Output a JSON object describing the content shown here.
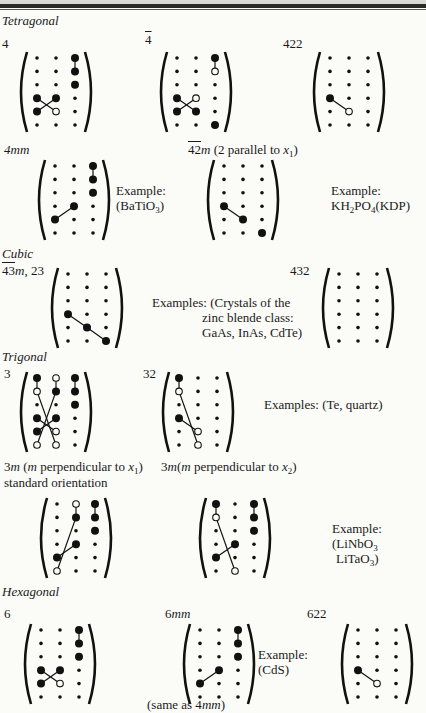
{
  "document": {
    "sections": [
      {
        "name": "Tetragonal",
        "groups": [
          {
            "label": "4",
            "x": 2,
            "y": 36,
            "matrix": "m4"
          },
          {
            "label": "4̄",
            "x": 145,
            "y": 32,
            "matrix": "m4bar"
          },
          {
            "label": "422",
            "x": 283,
            "y": 36,
            "matrix": "m422"
          },
          {
            "label": "4mm",
            "x": 2,
            "y": 142,
            "matrix": "m4mm",
            "example": [
              "Example:",
              "(BaTiO₃)"
            ]
          },
          {
            "label": "4̄2m (2 parallel to x₁)",
            "x": 188,
            "y": 142,
            "matrix": "m42m",
            "example": [
              "Example:",
              "KH₂PO₄(KDP)"
            ]
          }
        ]
      },
      {
        "name": "Cubic",
        "groups": [
          {
            "label": "4̄3m, 23",
            "x": 2,
            "y": 267,
            "matrix": "m43m",
            "example": [
              "Examples: (Crystals of the",
              "zinc blende class:",
              "GaAs, InAs, CdTe)"
            ]
          },
          {
            "label": "432",
            "x": 277,
            "y": 267,
            "matrix": "m432"
          }
        ]
      },
      {
        "name": "Trigonal",
        "groups": [
          {
            "label": "3",
            "x": 2,
            "y": 373,
            "matrix": "m3"
          },
          {
            "label": "32",
            "x": 143,
            "y": 373,
            "matrix": "m32",
            "example": [
              "Examples: (Te, quartz)"
            ]
          },
          {
            "label": "3m (m perpendicular to x₁) standard orientation",
            "matrix": "m3m1"
          },
          {
            "label": "3m(m perpendicular to x₂)",
            "matrix": "m3m2",
            "example": [
              "Example:",
              "(LiNbO₃",
              "LiTaO₃)"
            ]
          }
        ]
      },
      {
        "name": "Hexagonal",
        "groups": [
          {
            "label": "6",
            "matrix": "m6"
          },
          {
            "label": "6mm",
            "matrix": "m6mm",
            "example": [
              "Example:",
              "(CdS)"
            ],
            "note": "(same as 4mm)"
          },
          {
            "label": "622",
            "matrix": "m622"
          }
        ]
      }
    ],
    "text": {
      "tetragonal": "Tetragonal",
      "cubic": "Cubic",
      "trigonal": "Trigonal",
      "hexagonal": "Hexagonal",
      "l4": "4",
      "l4bar_num": "4",
      "l422": "422",
      "l4mm": "4mm",
      "l42m_a": "42",
      "l42m_m": "m",
      "l42m_b": " (2 parallel to ",
      "l42m_x": "x",
      "l42m_sub": "1",
      "l42m_c": ")",
      "ex_label": "Example:",
      "ex_batio_a": "(BaTiO",
      "ex_batio_sub": "3",
      "ex_batio_b": ")",
      "ex_kdp_a": "KH",
      "ex_kdp_sub1": "2",
      "ex_kdp_b": "PO",
      "ex_kdp_sub2": "4",
      "ex_kdp_c": "(KDP)",
      "l43m_a": "43",
      "l43m_m": "m",
      "l43m_b": ", 23",
      "ex_cubic_1": "Examples: (Crystals of the",
      "ex_cubic_2": "zinc blende class:",
      "ex_cubic_3": "GaAs, InAs, CdTe)",
      "l432": "432",
      "l3": "3",
      "l32": "32",
      "ex_trig": "Examples: (Te, quartz)",
      "l3m1_a": "3",
      "l3m1_m": "m",
      "l3m1_b": " (",
      "l3m1_m2": "m",
      "l3m1_c": " perpendicular to ",
      "l3m1_x": "x",
      "l3m1_sub": "1",
      "l3m1_d": ")",
      "l3m1_line2": "standard orientation",
      "l3m2_a": "3",
      "l3m2_m": "m",
      "l3m2_b": "(",
      "l3m2_m2": "m",
      "l3m2_c": " perpendicular to ",
      "l3m2_x": "x",
      "l3m2_sub": "2",
      "l3m2_d": ")",
      "ex_linbo_1": "Example:",
      "ex_linbo_2a": "(LiNbO",
      "ex_linbo_2sub": "3",
      "ex_linbo_3a": "LiTaO",
      "ex_linbo_3sub": "3",
      "ex_linbo_3b": ")",
      "l6": "6",
      "l6mm_a": "6",
      "l6mm_m": "mm",
      "l622": "622",
      "ex_cds": "(CdS)",
      "same_a": "(same as 4",
      "same_m": "mm",
      "same_b": ")"
    }
  },
  "matrices": {
    "legend": {
      "s": "small dot (zero)",
      "L": "large filled dot (non-zero)",
      "o": "open circle (equal magnitude, opposite sign)"
    },
    "m4": {
      "grid": [
        "ssL",
        "ssL",
        "ssL",
        "LLs",
        "Los",
        "sss"
      ],
      "lines": [
        [
          0,
          2,
          1,
          2
        ],
        [
          3,
          0,
          4,
          1
        ],
        [
          4,
          0,
          3,
          1
        ]
      ]
    },
    "m4bar": {
      "grid": [
        "ssL",
        "sso",
        "sss",
        "Los",
        "LLs",
        "ssL"
      ],
      "lines": [
        [
          0,
          2,
          1,
          2
        ],
        [
          3,
          0,
          4,
          1
        ],
        [
          4,
          0,
          3,
          1
        ]
      ]
    },
    "m422": {
      "grid": [
        "sss",
        "sss",
        "sss",
        "Lss",
        "sos",
        "sss"
      ],
      "lines": [
        [
          3,
          0,
          4,
          1
        ]
      ]
    },
    "m4mm": {
      "grid": [
        "ssL",
        "ssL",
        "ssL",
        "sLs",
        "Lss",
        "sss"
      ],
      "lines": [
        [
          0,
          2,
          1,
          2
        ],
        [
          4,
          0,
          3,
          1
        ]
      ]
    },
    "m42m": {
      "grid": [
        "sss",
        "sss",
        "sss",
        "Lss",
        "sLs",
        "ssL"
      ],
      "lines": [
        [
          3,
          0,
          4,
          1
        ]
      ]
    },
    "m43m": {
      "grid": [
        "sss",
        "sss",
        "sss",
        "Lss",
        "sLs",
        "ssL"
      ],
      "lines": [
        [
          3,
          0,
          4,
          1
        ],
        [
          4,
          1,
          5,
          2
        ]
      ]
    },
    "m432": {
      "grid": [
        "sss",
        "sss",
        "sss",
        "sss",
        "sss",
        "sss"
      ],
      "lines": []
    },
    "m3": {
      "grid": [
        "LoL",
        "oLL",
        "ssL",
        "LLs",
        "Los",
        "oos"
      ],
      "lines": [
        [
          0,
          0,
          1,
          0
        ],
        [
          0,
          1,
          1,
          1
        ],
        [
          0,
          2,
          1,
          2
        ],
        [
          1,
          0,
          5,
          1
        ],
        [
          1,
          1,
          5,
          0
        ],
        [
          3,
          0,
          4,
          1
        ],
        [
          4,
          0,
          3,
          1
        ]
      ]
    },
    "m32": {
      "grid": [
        "Lss",
        "oss",
        "sss",
        "Lss",
        "sos",
        "sos"
      ],
      "lines": [
        [
          0,
          0,
          1,
          0
        ],
        [
          1,
          0,
          5,
          1
        ],
        [
          3,
          0,
          4,
          1
        ]
      ]
    },
    "m3m1": {
      "grid": [
        "soL",
        "sLL",
        "ssL",
        "sLs",
        "Lss",
        "oss"
      ],
      "lines": [
        [
          0,
          1,
          1,
          1
        ],
        [
          0,
          2,
          1,
          2
        ],
        [
          1,
          1,
          5,
          0
        ],
        [
          4,
          0,
          3,
          1
        ]
      ]
    },
    "m3m2": {
      "grid": [
        "LsL",
        "osL",
        "ssL",
        "sLs",
        "Lss",
        "sos"
      ],
      "lines": [
        [
          0,
          0,
          1,
          0
        ],
        [
          0,
          2,
          1,
          2
        ],
        [
          1,
          0,
          5,
          1
        ],
        [
          4,
          0,
          3,
          1
        ]
      ]
    },
    "m6": {
      "grid": [
        "ssL",
        "ssL",
        "ssL",
        "LLs",
        "Los",
        "sss"
      ],
      "lines": [
        [
          0,
          2,
          1,
          2
        ],
        [
          3,
          0,
          4,
          1
        ],
        [
          4,
          0,
          3,
          1
        ]
      ]
    },
    "m6mm": {
      "grid": [
        "ssL",
        "ssL",
        "ssL",
        "sLs",
        "Lss",
        "sss"
      ],
      "lines": [
        [
          0,
          2,
          1,
          2
        ],
        [
          4,
          0,
          3,
          1
        ]
      ]
    },
    "m622": {
      "grid": [
        "sss",
        "sss",
        "sss",
        "Lss",
        "sos",
        "sss"
      ],
      "lines": [
        [
          3,
          0,
          4,
          1
        ]
      ]
    }
  }
}
